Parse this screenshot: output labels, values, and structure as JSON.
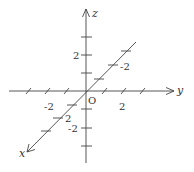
{
  "diagram": {
    "type": "3d-coordinate-axes",
    "origin_label": "O",
    "colors": {
      "axis": "#444444",
      "text": "#333333",
      "background": "#ffffff"
    },
    "axes": {
      "z": {
        "label": "z",
        "tick_labels": {
          "positive": "2",
          "negative": "-2"
        }
      },
      "y": {
        "label": "y",
        "tick_labels": {
          "positive": "2",
          "negative": "-2"
        }
      },
      "x": {
        "label": "x",
        "tick_labels": {
          "positive": "2",
          "negative": "-2"
        }
      }
    }
  }
}
